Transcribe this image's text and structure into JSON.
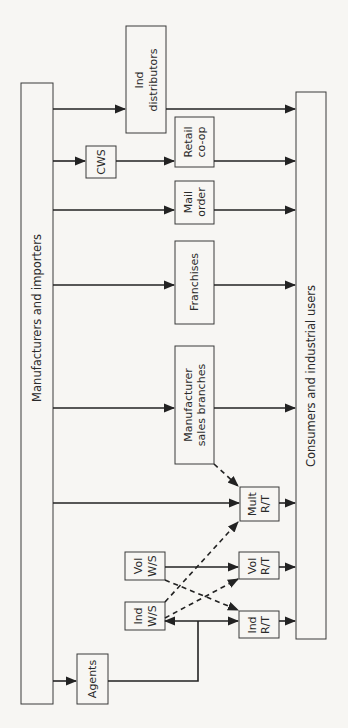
{
  "diagram": {
    "source_node": {
      "label": "Manufacturers and importers"
    },
    "sink_node": {
      "label": "Consumers and industrial users"
    },
    "nodes": {
      "ind_distributors": {
        "line1": "Ind",
        "line2": "distributors"
      },
      "cws": {
        "line1": "CWS"
      },
      "retail_coop": {
        "line1": "Retail",
        "line2": "co-op"
      },
      "mail_order": {
        "line1": "Mail",
        "line2": "order"
      },
      "franchises": {
        "line1": "Franchises"
      },
      "manufacturer_sales_branches": {
        "line1": "Manufacturer",
        "line2": "sales branches"
      },
      "mult_rt": {
        "line1": "Mult",
        "line2": "R/T"
      },
      "vol_ws": {
        "line1": "Vol",
        "line2": "W/S"
      },
      "vol_rt": {
        "line1": "Vol",
        "line2": "R/T"
      },
      "ind_ws": {
        "line1": "Ind",
        "line2": "W/S"
      },
      "ind_rt": {
        "line1": "Ind",
        "line2": "R/T"
      },
      "agents": {
        "line1": "Agents"
      }
    },
    "edges": [
      {
        "from": "Manufacturers and importers",
        "to": "Ind distributors",
        "style": "solid"
      },
      {
        "from": "Ind distributors",
        "to": "Consumers and industrial users",
        "style": "solid"
      },
      {
        "from": "Manufacturers and importers",
        "to": "CWS",
        "style": "solid"
      },
      {
        "from": "CWS",
        "to": "Retail co-op",
        "style": "solid"
      },
      {
        "from": "Retail co-op",
        "to": "Consumers and industrial users",
        "style": "solid"
      },
      {
        "from": "Manufacturers and importers",
        "to": "Mail order",
        "style": "solid"
      },
      {
        "from": "Mail order",
        "to": "Consumers and industrial users",
        "style": "solid"
      },
      {
        "from": "Manufacturers and importers",
        "to": "Franchises",
        "style": "solid"
      },
      {
        "from": "Franchises",
        "to": "Consumers and industrial users",
        "style": "solid"
      },
      {
        "from": "Manufacturers and importers",
        "to": "Manufacturer sales branches",
        "style": "solid"
      },
      {
        "from": "Manufacturer sales branches",
        "to": "Consumers and industrial users",
        "style": "solid"
      },
      {
        "from": "Manufacturer sales branches",
        "to": "Mult R/T",
        "style": "dashed"
      },
      {
        "from": "Manufacturers and importers",
        "to": "Mult R/T",
        "style": "solid"
      },
      {
        "from": "Mult R/T",
        "to": "Consumers and industrial users",
        "style": "solid"
      },
      {
        "from": "Ind W/S",
        "to": "Mult R/T",
        "style": "dashed"
      },
      {
        "from": "Vol W/S",
        "to": "Vol R/T",
        "style": "solid"
      },
      {
        "from": "Vol W/S",
        "to": "Ind R/T",
        "style": "dashed"
      },
      {
        "from": "Ind W/S",
        "to": "Vol R/T",
        "style": "dashed"
      },
      {
        "from": "Vol R/T",
        "to": "Consumers and industrial users",
        "style": "solid"
      },
      {
        "from": "Ind W/S",
        "to": "Ind R/T",
        "style": "solid"
      },
      {
        "from": "Ind R/T",
        "to": "Consumers and industrial users",
        "style": "solid"
      },
      {
        "from": "Manufacturers and importers",
        "to": "Agents",
        "style": "solid"
      },
      {
        "from": "Agents",
        "to": "Ind W/S",
        "style": "solid"
      },
      {
        "from": "Agents",
        "to": "Ind R/T",
        "style": "solid"
      }
    ]
  }
}
